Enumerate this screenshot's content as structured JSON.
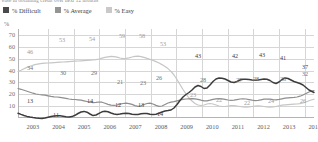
{
  "caption": "ease in obtaining credit over next 12 months",
  "legend": {
    "items": [
      {
        "label": "% Difficult",
        "color": "#4a4a4a",
        "key": "difficult"
      },
      {
        "label": "% Average",
        "color": "#949494",
        "key": "average"
      },
      {
        "label": "% Easy",
        "color": "#c9c9c9",
        "key": "easy"
      }
    ]
  },
  "axis": {
    "y_unit": "%",
    "y_ticks": [
      70,
      60,
      50,
      40,
      30,
      20,
      10
    ],
    "y_min": 0,
    "y_max": 75,
    "x_ticks": [
      "2003",
      "2004",
      "2005",
      "2006",
      "2007",
      "2008",
      "2009",
      "2010",
      "2011",
      "2012",
      "2013",
      "2014"
    ]
  },
  "chart_data": {
    "type": "line",
    "title": "",
    "subtitle": "ease in obtaining credit over next 12 months",
    "xlabel": "",
    "ylabel": "%",
    "ylim": [
      0,
      75
    ],
    "grid": true,
    "legend_position": "top-left",
    "x": [
      "2003",
      "2004",
      "2005",
      "2006",
      "2007",
      "2008",
      "2009",
      "2010",
      "2011",
      "2012",
      "2013",
      "2014"
    ],
    "series": [
      {
        "name": "% Difficult",
        "color": "#3c3c3c",
        "values": [
          13,
          11,
          12,
          14,
          12,
          14,
          27,
          43,
          38,
          42,
          43,
          37
        ],
        "labels": [
          {
            "x": "2003",
            "value": 13
          },
          {
            "x": "2004",
            "value": 11
          },
          {
            "x": "2006",
            "value": 14
          },
          {
            "x": "2007",
            "value": 12
          },
          {
            "x": "2008",
            "value": 14
          },
          {
            "x": "2009",
            "value": 27
          },
          {
            "x": "2010",
            "value": 43
          },
          {
            "x": "2011",
            "value": 42
          },
          {
            "x": "2012",
            "value": 43
          },
          {
            "x": "2013",
            "value": 41
          },
          {
            "x": "2014",
            "value": 37
          }
        ]
      },
      {
        "name": "% Average",
        "color": "#8e8e8e",
        "values": [
          34,
          30,
          29,
          21,
          23,
          26,
          28,
          28,
          27,
          28,
          28,
          32
        ],
        "labels": [
          {
            "x": "2003",
            "value": 34
          },
          {
            "x": "2005",
            "value": 30
          },
          {
            "x": "2006",
            "value": 29
          },
          {
            "x": "2007",
            "value": 21
          },
          {
            "x": "2008",
            "value": 23
          },
          {
            "x": "2008.5",
            "value": 26
          },
          {
            "x": "2010",
            "value": 28
          },
          {
            "x": "2011",
            "value": 27
          },
          {
            "x": "2012",
            "value": 28
          },
          {
            "x": "2013",
            "value": 28
          },
          {
            "x": "2014",
            "value": 32
          }
        ]
      },
      {
        "name": "% Easy",
        "color": "#c6c6c6",
        "values": [
          46,
          53,
          54,
          59,
          58,
          53,
          23,
          22,
          22,
          24,
          24,
          26
        ],
        "labels": [
          {
            "x": "2003",
            "value": 46
          },
          {
            "x": "2004",
            "value": 53
          },
          {
            "x": "2005",
            "value": 54
          },
          {
            "x": "2006",
            "value": 59
          },
          {
            "x": "2007",
            "value": 58
          },
          {
            "x": "2008",
            "value": 53
          },
          {
            "x": "2010",
            "value": 23
          },
          {
            "x": "2011",
            "value": 22
          },
          {
            "x": "2012",
            "value": 22
          },
          {
            "x": "2013",
            "value": 24
          },
          {
            "x": "2014",
            "value": 26
          }
        ]
      }
    ]
  },
  "annotations": [
    {
      "text": "46",
      "left": 30,
      "top": 52,
      "cls": "easy"
    },
    {
      "text": "53",
      "left": 62,
      "top": 40,
      "cls": "easy"
    },
    {
      "text": "54",
      "left": 92,
      "top": 39,
      "cls": "easy"
    },
    {
      "text": "59",
      "left": 122,
      "top": 36,
      "cls": "easy"
    },
    {
      "text": "58",
      "left": 142,
      "top": 36,
      "cls": "easy"
    },
    {
      "text": "53",
      "left": 163,
      "top": 44,
      "cls": "easy"
    },
    {
      "text": "23",
      "left": 193,
      "top": 95,
      "cls": "easy"
    },
    {
      "text": "22",
      "left": 219,
      "top": 100,
      "cls": "easy"
    },
    {
      "text": "22",
      "left": 247,
      "top": 103,
      "cls": "easy"
    },
    {
      "text": "24",
      "left": 271,
      "top": 101,
      "cls": "easy"
    },
    {
      "text": "26",
      "left": 303,
      "top": 101,
      "cls": "easy"
    },
    {
      "text": "34",
      "left": 30,
      "top": 68,
      "cls": "average"
    },
    {
      "text": "30",
      "left": 63,
      "top": 73,
      "cls": "average"
    },
    {
      "text": "29",
      "left": 94,
      "top": 73,
      "cls": "average"
    },
    {
      "text": "21",
      "left": 120,
      "top": 82,
      "cls": "average"
    },
    {
      "text": "23",
      "left": 143,
      "top": 83,
      "cls": "average"
    },
    {
      "text": "26",
      "left": 159,
      "top": 78,
      "cls": "average"
    },
    {
      "text": "28",
      "left": 203,
      "top": 80,
      "cls": "average"
    },
    {
      "text": "27",
      "left": 239,
      "top": 80,
      "cls": "average"
    },
    {
      "text": "28",
      "left": 256,
      "top": 79,
      "cls": "average"
    },
    {
      "text": "28",
      "left": 283,
      "top": 79,
      "cls": "average"
    },
    {
      "text": "32",
      "left": 305,
      "top": 74,
      "cls": "average"
    },
    {
      "text": "13",
      "left": 30,
      "top": 101,
      "cls": "difficult"
    },
    {
      "text": "11",
      "left": 56,
      "top": 115,
      "cls": "difficult"
    },
    {
      "text": "14",
      "left": 90,
      "top": 101,
      "cls": "difficult"
    },
    {
      "text": "12",
      "left": 118,
      "top": 105,
      "cls": "difficult"
    },
    {
      "text": "13",
      "left": 141,
      "top": 105,
      "cls": "difficult"
    },
    {
      "text": "14",
      "left": 160,
      "top": 114,
      "cls": "difficult"
    },
    {
      "text": "43",
      "left": 198,
      "top": 56,
      "cls": "difficult"
    },
    {
      "text": "42",
      "left": 235,
      "top": 56,
      "cls": "difficult"
    },
    {
      "text": "43",
      "left": 262,
      "top": 55,
      "cls": "difficult"
    },
    {
      "text": "41",
      "left": 283,
      "top": 58,
      "cls": "difficult"
    },
    {
      "text": "37",
      "left": 305,
      "top": 67,
      "cls": "difficult"
    }
  ],
  "paths": {
    "difficult": "M0,84.2 L3,85.4 L6,86.5 L9,87.4 L12,88.1 L15,88.6 L18,89.0 L21,89.3 L24,89.4 L27,89.0 L30,88.3 L33,87.6 L36,87.0 L39,86.7 L42,86.8 L45,87.2 L48,87.7 L51,88.0 L54,87.6 L57,86.3 L60,84.5 L63,83.0 L66,82.4 L69,83.2 L72,85.0 L75,86.6 L78,86.0 L81,84.3 L84,82.8 L87,82.2 L90,82.8 L93,84.0 L96,85.0 L99,85.4 L102,85.0 L105,84.4 L108,84.2 L111,84.6 L114,85.2 L117,85.6 L120,85.4 L123,84.8 L126,84.4 L129,84.6 L132,85.2 L135,85.6 L138,85.2 L141,84.2 L144,83.0 L147,82.0 L150,81.6 L153,81.0 L156,79.0 L159,75.5 L162,71.5 L165,68.0 L168,65.5 L171,63.5 L174,61.0 L177,58.0 L180,56.5 L183,57.5 L186,59.5 L189,59.0 L192,56.0 L195,52.5 L198,50.0 L201,49.0 L204,49.2 L207,50.0 L210,51.5 L213,53.0 L216,53.5 L219,52.5 L222,51.0 L225,50.2 L228,50.2 L231,50.6 L234,51.0 L237,51.2 L240,51.0 L243,50.5 L246,50.0 L249,50.2 L252,51.5 L255,53.5 L258,54.5 L261,53.0 L264,50.5 L267,49.0 L270,49.5 L273,51.0 L276,52.5 L279,53.5 L282,54.5 L285,56.0 L288,58.5 L291,61.0 L294,62.5 L296,63.5",
    "average": "M0,59.5 L3,60.3 L6,61.2 L9,62.2 L12,63.2 L15,64.2 L18,65.0 L21,65.5 L24,65.8 L27,66.2 L30,66.8 L33,67.4 L36,67.8 L39,68.0 L42,68.3 L45,68.8 L48,69.4 L51,70.0 L54,70.3 L57,70.5 L60,70.8 L63,71.2 L66,71.8 L69,72.5 L72,73.2 L75,73.6 L78,73.4 L81,73.0 L84,73.2 L87,74.2 L90,75.4 L93,76.2 L96,76.4 L99,76.0 L102,75.2 L105,74.5 L108,74.2 L111,74.6 L114,75.4 L117,76.6 L120,77.4 L123,76.8 L126,75.5 L129,74.5 L132,74.2 L135,75.0 L138,76.4 L141,77.4 L144,77.0 L147,75.5 L150,74.0 L153,73.2 L156,72.6 L159,71.8 L162,71.0 L165,70.4 L168,70.0 L171,69.8 L174,69.6 L177,69.8 L180,70.4 L183,71.2 L186,71.8 L189,71.8 L192,71.2 L195,70.4 L198,69.8 L201,69.6 L204,69.8 L207,70.4 L210,71.0 L213,71.4 L216,71.2 L219,70.6 L222,70.0 L225,69.8 L228,70.0 L231,70.6 L234,71.2 L237,71.6 L240,71.4 L243,70.8 L246,70.2 L249,70.0 L252,70.2 L255,70.6 L258,70.8 L261,70.4 L264,69.8 L267,69.2 L270,68.8 L273,68.6 L276,68.4 L279,68.0 L282,67.2 L285,66.0 L288,64.5 L291,63.0 L294,62.0 L296,61.5",
    "easy": "M0,42.5 L3,41.2 L6,39.8 L9,38.4 L12,37.2 L15,36.2 L18,35.4 L21,34.8 L24,34.4 L27,34.2 L30,34.0 L33,33.8 L36,33.6 L39,33.4 L42,33.2 L45,33.0 L48,32.8 L51,32.6 L54,32.4 L57,32.2 L60,32.0 L63,31.8 L66,31.6 L69,31.4 L72,31.2 L75,31.0 L78,30.6 L81,30.0 L84,29.2 L87,28.4 L90,27.8 L93,27.4 L96,27.6 L99,28.2 L102,29.0 L105,29.6 L108,29.4 L111,28.8 L114,28.0 L117,27.4 L120,27.2 L123,27.6 L126,28.4 L129,29.4 L132,30.4 L135,31.4 L138,32.6 L141,34.0 L144,35.6 L147,37.4 L150,39.6 L153,42.4 L156,46.0 L159,50.5 L162,55.5 L165,60.5 L168,65.0 L171,69.0 L174,72.0 L177,74.5 L180,76.0 L183,76.5 L186,76.0 L189,75.0 L192,74.5 L195,75.0 L198,76.0 L201,77.0 L204,77.5 L207,77.5 L210,77.0 L213,76.5 L216,76.5 L219,77.0 L222,77.5 L225,78.0 L228,78.2 L231,78.0 L234,77.5 L237,77.0 L240,76.8 L243,77.0 L246,77.5 L249,78.0 L252,78.2 L255,78.0 L258,77.5 L261,76.8 L264,76.2 L267,75.8 L270,75.6 L273,75.4 L276,75.2 L279,75.0 L282,74.6 L285,74.0 L288,73.0 L291,71.8 L294,70.8 L296,70.2"
  }
}
